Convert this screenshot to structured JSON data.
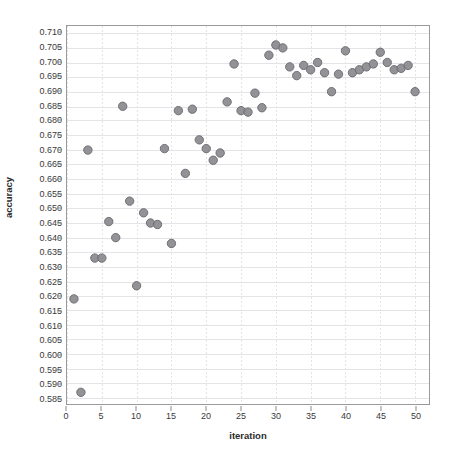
{
  "chart_data": {
    "type": "scatter",
    "title": "",
    "xlabel": "iteration",
    "ylabel": "accuracy",
    "xlim": [
      0,
      52
    ],
    "ylim": [
      0.583,
      0.7125
    ],
    "grid": true,
    "legend": null,
    "xticks": [
      0,
      5,
      10,
      15,
      20,
      25,
      30,
      35,
      40,
      45,
      50
    ],
    "xtick_labels": [
      "0",
      "5",
      "10",
      "15",
      "20",
      "25",
      "30",
      "35",
      "40",
      "45",
      "50"
    ],
    "yticks": [
      0.585,
      0.59,
      0.595,
      0.6,
      0.605,
      0.61,
      0.615,
      0.62,
      0.625,
      0.63,
      0.635,
      0.64,
      0.645,
      0.65,
      0.655,
      0.66,
      0.665,
      0.67,
      0.675,
      0.68,
      0.685,
      0.69,
      0.695,
      0.7,
      0.705,
      0.71
    ],
    "ytick_labels": [
      "0.585",
      "0.590",
      "0.595",
      "0.600",
      "0.605",
      "0.610",
      "0.615",
      "0.620",
      "0.625",
      "0.630",
      "0.635",
      "0.640",
      "0.645",
      "0.650",
      "0.655",
      "0.660",
      "0.665",
      "0.670",
      "0.675",
      "0.680",
      "0.685",
      "0.690",
      "0.695",
      "0.700",
      "0.705",
      "0.710"
    ],
    "marker": {
      "shape": "circle",
      "size": 4.2,
      "fill_color": "#8a8a8e",
      "edge_color": "#6e6e73"
    },
    "colors": {
      "grid": "#e3e3e8",
      "frame": "#9a9a9a",
      "text": "#2b2b2b"
    },
    "x": [
      1,
      2,
      3,
      4,
      5,
      6,
      7,
      8,
      9,
      10,
      11,
      12,
      13,
      14,
      15,
      16,
      17,
      18,
      19,
      20,
      21,
      22,
      23,
      24,
      25,
      26,
      27,
      28,
      29,
      30,
      31,
      32,
      33,
      34,
      35,
      36,
      37,
      38,
      39,
      40,
      41,
      42,
      43,
      44,
      45,
      46,
      47,
      48,
      49,
      50
    ],
    "y": [
      0.619,
      0.587,
      0.67,
      0.633,
      0.633,
      0.6455,
      0.64,
      0.685,
      0.6525,
      0.6235,
      0.6485,
      0.645,
      0.6445,
      0.6705,
      0.638,
      0.6835,
      0.662,
      0.684,
      0.6735,
      0.6705,
      0.6665,
      0.669,
      0.6865,
      0.6995,
      0.6835,
      0.683,
      0.6895,
      0.6845,
      0.7025,
      0.706,
      0.705,
      0.6985,
      0.6955,
      0.699,
      0.6975,
      0.7,
      0.6965,
      0.69,
      0.696,
      0.704,
      0.6965,
      0.6975,
      0.6985,
      0.6995,
      0.7035,
      0.7,
      0.6975,
      0.698,
      0.699,
      0.69
    ],
    "series_name": "accuracy vs iteration",
    "n_points": 50
  }
}
